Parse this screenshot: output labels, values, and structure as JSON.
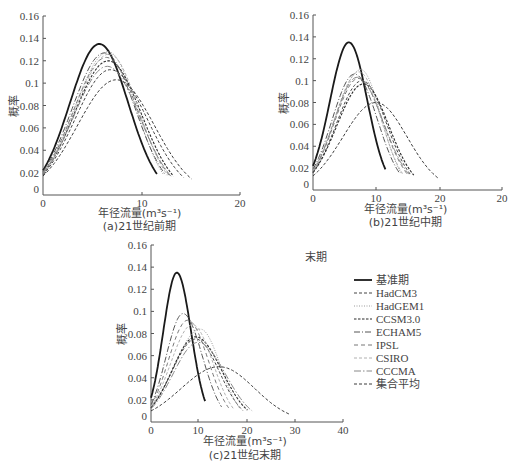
{
  "chart_data": [
    {
      "id": "a",
      "type": "line",
      "caption": "(a)21世纪前期",
      "xlabel": "年径流量(m³s⁻¹)",
      "ylabel": "概率",
      "xlim": [
        0,
        20
      ],
      "ylim": [
        0,
        0.16
      ],
      "x_ticks": [
        "0",
        "10",
        "20"
      ],
      "y_ticks": [
        "0",
        "0.02",
        "0.04",
        "0.06",
        "0.08",
        "0.1",
        "0.12",
        "0.14",
        "0.16"
      ],
      "series": [
        {
          "name": "基准期",
          "peak_x": 5.7,
          "peak_y": 0.135,
          "x_end": 11.5,
          "y_start": 0.022
        },
        {
          "name": "HadCM3",
          "peak_x": 6.8,
          "peak_y": 0.112,
          "x_end": 14.2,
          "y_start": 0.018
        },
        {
          "name": "HadGEM1",
          "peak_x": 6.6,
          "peak_y": 0.128,
          "x_end": 12.2,
          "y_start": 0.02
        },
        {
          "name": "CCSM3.0",
          "peak_x": 6.6,
          "peak_y": 0.12,
          "x_end": 13.2,
          "y_start": 0.019
        },
        {
          "name": "ECHAM5",
          "peak_x": 6.2,
          "peak_y": 0.127,
          "x_end": 12.4,
          "y_start": 0.021
        },
        {
          "name": "IPSL",
          "peak_x": 6.4,
          "peak_y": 0.123,
          "x_end": 12.8,
          "y_start": 0.02
        },
        {
          "name": "CSIRO",
          "peak_x": 6.7,
          "peak_y": 0.126,
          "x_end": 12.6,
          "y_start": 0.019
        },
        {
          "name": "CCCMA",
          "peak_x": 6.5,
          "peak_y": 0.115,
          "x_end": 13.0,
          "y_start": 0.019
        },
        {
          "name": "集合平均",
          "peak_x": 7.4,
          "peak_y": 0.103,
          "x_end": 15.0,
          "y_start": 0.017
        }
      ]
    },
    {
      "id": "b",
      "type": "line",
      "caption": "(b)21世纪中期",
      "xlabel": "年径流量(m³s⁻¹)",
      "ylabel": "概率",
      "xlim": [
        0,
        30
      ],
      "ylim": [
        0,
        0.16
      ],
      "x_ticks": [
        "0",
        "10",
        "20",
        "20"
      ],
      "y_ticks": [
        "0",
        "0.02",
        "0.04",
        "0.06",
        "0.08",
        "0.1",
        "0.12",
        "0.14",
        "0.16"
      ],
      "series": [
        {
          "name": "基准期",
          "peak_x": 5.7,
          "peak_y": 0.135,
          "x_end": 11.5,
          "y_start": 0.022
        },
        {
          "name": "HadCM3",
          "peak_x": 7.8,
          "peak_y": 0.1,
          "x_end": 15.5,
          "y_start": 0.016
        },
        {
          "name": "HadGEM1",
          "peak_x": 7.6,
          "peak_y": 0.11,
          "x_end": 14.0,
          "y_start": 0.018
        },
        {
          "name": "CCSM3.0",
          "peak_x": 8.0,
          "peak_y": 0.097,
          "x_end": 16.0,
          "y_start": 0.016
        },
        {
          "name": "ECHAM5",
          "peak_x": 6.6,
          "peak_y": 0.106,
          "x_end": 13.8,
          "y_start": 0.019
        },
        {
          "name": "IPSL",
          "peak_x": 7.2,
          "peak_y": 0.102,
          "x_end": 15.0,
          "y_start": 0.017
        },
        {
          "name": "CSIRO",
          "peak_x": 7.3,
          "peak_y": 0.108,
          "x_end": 14.2,
          "y_start": 0.018
        },
        {
          "name": "CCCMA",
          "peak_x": 7.0,
          "peak_y": 0.103,
          "x_end": 15.2,
          "y_start": 0.017
        },
        {
          "name": "集合平均",
          "peak_x": 10.0,
          "peak_y": 0.08,
          "x_end": 19.8,
          "y_start": 0.013
        }
      ]
    },
    {
      "id": "c",
      "type": "line",
      "caption": "(c)21世纪末期",
      "xlabel": "年径流量(m³s⁻¹)",
      "ylabel": "概率",
      "xlim": [
        0,
        40
      ],
      "ylim": [
        0,
        0.16
      ],
      "x_ticks": [
        "0",
        "10",
        "20",
        "30",
        "40"
      ],
      "y_ticks": [
        "0",
        "0.02",
        "0.04",
        "0.06",
        "0.08",
        "0.1",
        "0.12",
        "0.14",
        "0.16"
      ],
      "series": [
        {
          "name": "基准期",
          "peak_x": 5.5,
          "peak_y": 0.135,
          "x_end": 11.5,
          "y_start": 0.022
        },
        {
          "name": "HadCM3",
          "peak_x": 9.5,
          "peak_y": 0.075,
          "x_end": 19.5,
          "y_start": 0.013
        },
        {
          "name": "HadGEM1",
          "peak_x": 10.5,
          "peak_y": 0.084,
          "x_end": 19.0,
          "y_start": 0.014
        },
        {
          "name": "CCSM3.0",
          "peak_x": 9.5,
          "peak_y": 0.077,
          "x_end": 20.5,
          "y_start": 0.013
        },
        {
          "name": "ECHAM5",
          "peak_x": 6.8,
          "peak_y": 0.098,
          "x_end": 15.0,
          "y_start": 0.016
        },
        {
          "name": "IPSL",
          "peak_x": 7.8,
          "peak_y": 0.092,
          "x_end": 16.5,
          "y_start": 0.015
        },
        {
          "name": "CSIRO",
          "peak_x": 8.8,
          "peak_y": 0.088,
          "x_end": 17.5,
          "y_start": 0.014
        },
        {
          "name": "CCCMA",
          "peak_x": 10.0,
          "peak_y": 0.072,
          "x_end": 21.5,
          "y_start": 0.012
        },
        {
          "name": "集合平均",
          "peak_x": 14.5,
          "peak_y": 0.05,
          "x_end": 29.5,
          "y_start": 0.01
        }
      ]
    }
  ],
  "legend": {
    "title_fragment": "末期",
    "items": [
      {
        "label": "基准期",
        "style": "solid-thick",
        "color": "#1a1a1a"
      },
      {
        "label": "HadCM3",
        "style": "dash",
        "color": "#444444"
      },
      {
        "label": "HadGEM1",
        "style": "dot",
        "color": "#9a9a9a"
      },
      {
        "label": "CCSM3.0",
        "style": "dash-dense",
        "color": "#2a2a2a"
      },
      {
        "label": "ECHAM5",
        "style": "dash-dot",
        "color": "#555555"
      },
      {
        "label": "IPSL",
        "style": "dash-long",
        "color": "#777777"
      },
      {
        "label": "CSIRO",
        "style": "dash-light",
        "color": "#b0b0b0"
      },
      {
        "label": "CCCMA",
        "style": "dash-dot-light",
        "color": "#888888"
      },
      {
        "label": "集合平均",
        "style": "dash",
        "color": "#3a3a3a"
      }
    ]
  }
}
